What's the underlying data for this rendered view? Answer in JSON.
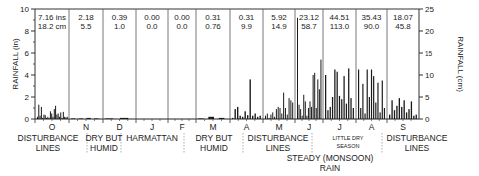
{
  "chart_data": {
    "type": "bar",
    "title": "",
    "ylabel_left": "RAINFALL (in)",
    "ylabel_right": "RAINFALL (cm)",
    "ylim_left": [
      0,
      10
    ],
    "ylim_right": [
      0,
      25
    ],
    "left_ticks": [
      "0",
      "2",
      "4",
      "6",
      "8",
      "10"
    ],
    "right_ticks": [
      "0",
      "5",
      "10",
      "15",
      "20",
      "25"
    ],
    "grid": false,
    "months": [
      "O",
      "N",
      "D",
      "J",
      "F",
      "M",
      "A",
      "M",
      "J",
      "J",
      "A",
      "S"
    ],
    "monthly_totals": [
      {
        "in": "7.16 ins",
        "cm": "18.2 cm"
      },
      {
        "in": "2.18",
        "cm": "5.5"
      },
      {
        "in": "0.39",
        "cm": "1.0"
      },
      {
        "in": "0.00",
        "cm": "0.0"
      },
      {
        "in": "0.00",
        "cm": "0.0"
      },
      {
        "in": "0.31",
        "cm": "0.76"
      },
      {
        "in": "0.31",
        "cm": "9.9"
      },
      {
        "in": "5.92",
        "cm": "14.9"
      },
      {
        "in": "23.12",
        "cm": "58.7"
      },
      {
        "in": "44.51",
        "cm": "113.0"
      },
      {
        "in": "35.43",
        "cm": "90.0"
      },
      {
        "in": "18.07",
        "cm": "45.8"
      }
    ],
    "seasons": [
      {
        "line1": "DISTURBANCE",
        "line2": "LINES"
      },
      {
        "line1": "DRY BUT",
        "line2": "HUMID"
      },
      {
        "line1": "HARMATTAN",
        "line2": ""
      },
      {
        "line1": "DRY BUT",
        "line2": "HUMID"
      },
      {
        "line1": "DISTURBANCE",
        "line2": "LINES"
      },
      {
        "line1": "LITTLE DRY",
        "line2": "SEASON"
      },
      {
        "line1": "DISTURBANCE",
        "line2": "LINES"
      }
    ],
    "monsoon_label": {
      "line1": "STEADY (MONSOON)",
      "line2": "RAIN"
    },
    "daily_bars_in": [
      [
        0.2,
        1.3,
        0.3,
        1.1,
        0.1,
        0.4,
        0.35,
        0.1,
        0.2,
        0.1,
        0.7,
        0.5,
        0.2,
        0.9,
        1.2,
        0.4,
        0.5,
        0.2,
        0.6,
        0.1,
        0.65,
        0.2,
        0.15,
        0.2
      ],
      [
        0.05,
        0.05,
        0.1,
        0.05
      ],
      [
        0.05,
        0.1
      ],
      [],
      [],
      [
        0.05,
        0.2,
        0.1
      ],
      [
        0.1,
        0.9,
        1.1,
        0.3,
        0.2,
        0.7,
        0.35,
        3.6,
        0.3,
        0.5,
        0.2,
        0.3
      ],
      [
        0.3,
        0.5,
        0.1,
        0.4,
        0.6,
        0.2,
        0.9,
        1.1,
        1.0,
        0.5,
        2.4,
        1.0,
        0.4,
        1.9,
        1.7,
        1.5
      ],
      [
        9.2,
        1.3,
        0.9,
        0.3,
        2.2,
        1.6,
        0.3,
        1.0,
        1.6,
        1.1,
        4.0,
        4.2,
        1.0,
        3.6,
        2.7,
        5.4
      ],
      [
        4.0,
        0.8,
        1.1,
        2.0,
        4.5,
        4.3,
        2.1,
        1.8,
        3.9,
        1.4,
        4.6,
        1.9,
        1.0
      ],
      [
        4.5,
        1.0,
        3.2,
        0.5,
        4.5,
        2.0,
        4.5,
        3.9,
        1.5,
        3.3,
        0.6,
        3.5,
        1.0
      ],
      [
        0.4,
        1.7,
        0.8,
        1.2,
        1.9,
        1.1,
        1.7,
        0.6,
        0.9,
        1.6,
        0.3,
        0.4
      ]
    ]
  }
}
